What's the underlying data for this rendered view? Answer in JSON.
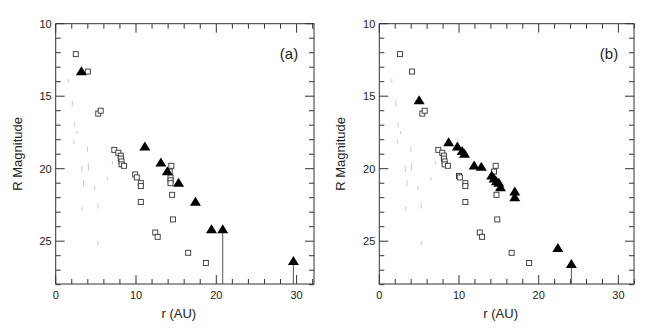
{
  "figure": {
    "width": 652,
    "height": 335,
    "colors": {
      "axis": "#333333",
      "marker_open_square": "#333333",
      "marker_triangle": "#000000",
      "background_noise": "#c8c8c8"
    }
  },
  "chart_data": [
    {
      "type": "scatter",
      "panel_label": "(a)",
      "title": "",
      "xlabel": "r (AU)",
      "ylabel": "R Magnitude",
      "xlim": [
        0,
        32.2
      ],
      "ylim": [
        28,
        10
      ],
      "y_inverted": true,
      "x_ticks": [
        0,
        10,
        20,
        30
      ],
      "x_minor_step": 2,
      "y_ticks": [
        10,
        15,
        20,
        25
      ],
      "y_minor_step": 1,
      "grid": false,
      "legend": null,
      "series": [
        {
          "name": "open squares",
          "marker": "open-square",
          "points": [
            [
              2.5,
              12.1
            ],
            [
              4.0,
              13.3
            ],
            [
              5.3,
              16.2
            ],
            [
              5.6,
              16.0
            ],
            [
              7.3,
              18.7
            ],
            [
              7.8,
              18.9
            ],
            [
              8.1,
              19.1
            ],
            [
              8.1,
              19.3
            ],
            [
              8.2,
              19.5
            ],
            [
              8.2,
              19.7
            ],
            [
              8.5,
              19.8
            ],
            [
              9.9,
              20.4
            ],
            [
              10.1,
              20.6
            ],
            [
              10.6,
              21.0
            ],
            [
              10.6,
              21.2
            ],
            [
              10.6,
              22.3
            ],
            [
              14.4,
              19.8
            ],
            [
              14.2,
              20.2
            ],
            [
              14.3,
              20.6
            ],
            [
              14.3,
              20.8
            ],
            [
              14.3,
              21.0
            ],
            [
              14.5,
              21.8
            ],
            [
              14.6,
              23.5
            ],
            [
              12.4,
              24.4
            ],
            [
              12.7,
              24.7
            ],
            [
              16.5,
              25.8
            ],
            [
              18.7,
              26.5
            ]
          ]
        },
        {
          "name": "filled triangles",
          "marker": "filled-triangle",
          "points": [
            [
              3.2,
              13.3
            ],
            [
              11.1,
              18.5
            ],
            [
              13.1,
              19.6
            ],
            [
              13.9,
              20.2
            ],
            [
              15.3,
              21.0
            ],
            [
              17.4,
              22.3
            ],
            [
              19.4,
              24.2
            ]
          ]
        },
        {
          "name": "upper limits (triangles with arrows)",
          "marker": "filled-triangle-with-drop-line",
          "points": [
            [
              20.8,
              24.2
            ],
            [
              29.6,
              26.4
            ]
          ]
        }
      ]
    },
    {
      "type": "scatter",
      "panel_label": "(b)",
      "title": "",
      "xlabel": "r (AU)",
      "ylabel": "R Magnitude",
      "xlim": [
        0,
        32.0
      ],
      "ylim": [
        28,
        10
      ],
      "y_inverted": true,
      "x_ticks": [
        0,
        10,
        20,
        30
      ],
      "x_minor_step": 2,
      "y_ticks": [
        10,
        15,
        20,
        25
      ],
      "y_minor_step": 1,
      "grid": false,
      "legend": null,
      "series": [
        {
          "name": "open squares",
          "marker": "open-square",
          "points": [
            [
              2.6,
              12.1
            ],
            [
              4.1,
              13.3
            ],
            [
              5.4,
              16.2
            ],
            [
              5.7,
              16.0
            ],
            [
              7.4,
              18.7
            ],
            [
              7.9,
              18.9
            ],
            [
              8.1,
              19.1
            ],
            [
              8.1,
              19.3
            ],
            [
              8.2,
              19.5
            ],
            [
              8.2,
              19.7
            ],
            [
              8.6,
              19.8
            ],
            [
              10.0,
              20.5
            ],
            [
              10.1,
              20.6
            ],
            [
              10.8,
              21.0
            ],
            [
              10.8,
              21.2
            ],
            [
              10.8,
              22.3
            ],
            [
              14.6,
              19.8
            ],
            [
              14.4,
              20.2
            ],
            [
              14.7,
              21.8
            ],
            [
              14.8,
              23.5
            ],
            [
              12.6,
              24.4
            ],
            [
              12.9,
              24.7
            ],
            [
              16.6,
              25.8
            ],
            [
              18.8,
              26.5
            ]
          ]
        },
        {
          "name": "filled triangles",
          "marker": "filled-triangle",
          "points": [
            [
              5.0,
              15.3
            ],
            [
              8.7,
              18.2
            ],
            [
              9.8,
              18.5
            ],
            [
              10.4,
              18.8
            ],
            [
              10.7,
              19.0
            ],
            [
              11.9,
              19.8
            ],
            [
              12.8,
              19.9
            ],
            [
              14.1,
              20.5
            ],
            [
              14.4,
              20.7
            ],
            [
              14.7,
              20.9
            ],
            [
              15.0,
              21.0
            ],
            [
              15.2,
              21.3
            ],
            [
              17.0,
              21.6
            ],
            [
              17.0,
              22.0
            ],
            [
              22.4,
              25.5
            ]
          ]
        },
        {
          "name": "upper limits (triangles with arrows)",
          "marker": "filled-triangle-with-drop-line",
          "points": [
            [
              24.1,
              26.6
            ]
          ]
        }
      ]
    }
  ],
  "panels": [
    {
      "left": 55.7,
      "top": 23.7,
      "right": 314,
      "bottom": 284,
      "px_per_x": 8.03,
      "px_per_y": 14.5
    },
    {
      "left": 379.3,
      "top": 23.7,
      "right": 634,
      "bottom": 284,
      "px_per_x": 7.97,
      "px_per_y": 14.5
    }
  ]
}
